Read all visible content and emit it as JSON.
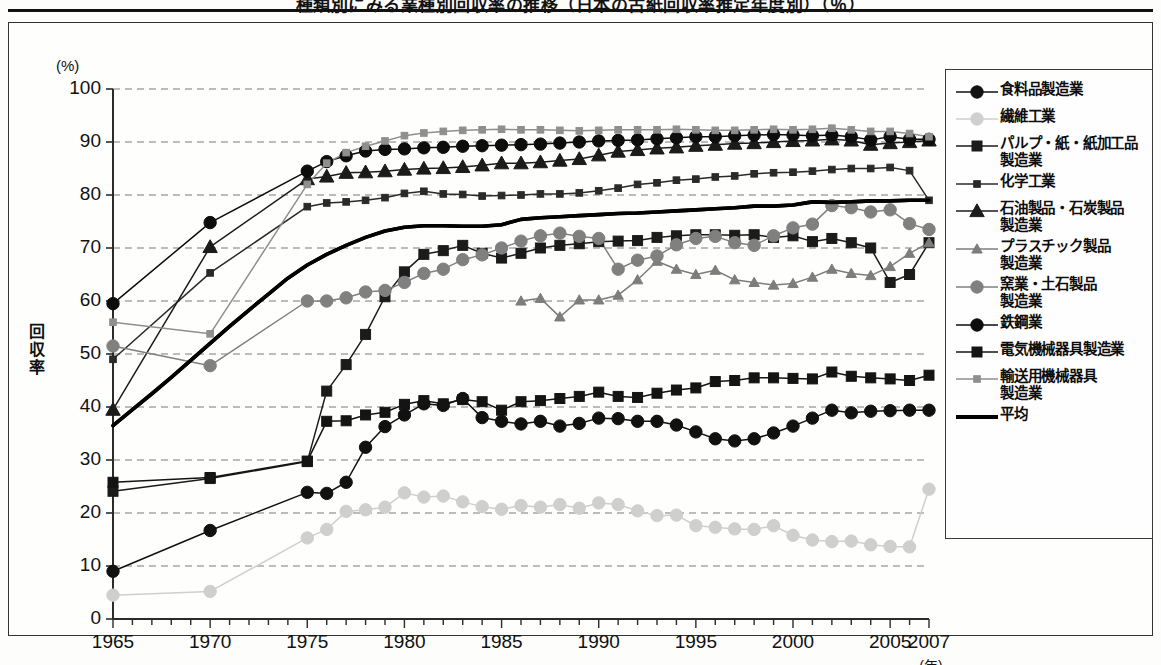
{
  "title": "種類別にみる業種別回収率の推移（日本の古紙回収率推定年度別）（％）",
  "axes": {
    "y_unit": "(%)",
    "y_title": "回収率",
    "y_ticks": [
      0,
      10,
      20,
      30,
      40,
      50,
      60,
      70,
      80,
      90,
      100
    ],
    "x_unit": "(年)",
    "x_ticks": [
      1965,
      1970,
      1975,
      1980,
      1985,
      1990,
      1995,
      2000,
      2005,
      2007
    ]
  },
  "legend": {
    "items": [
      {
        "label": "食料品製造業",
        "marker": "circle",
        "color": "#111111",
        "size": "large",
        "icon": "legend-marker-circle"
      },
      {
        "label": "繊維工業",
        "marker": "circle",
        "color": "#cfcfcf",
        "size": "large",
        "icon": "legend-marker-circle"
      },
      {
        "label": "パルプ・紙・紙加工品\n製造業",
        "marker": "square",
        "color": "#1b1b1b",
        "size": "large",
        "icon": "legend-marker-square"
      },
      {
        "label": "化学工業",
        "marker": "square",
        "color": "#2a2a2a",
        "size": "small",
        "icon": "legend-marker-square"
      },
      {
        "label": "石油製品・石炭製品\n製造業",
        "marker": "triangle",
        "color": "#1b1b1b",
        "size": "large",
        "icon": "legend-marker-triangle"
      },
      {
        "label": "プラスチック製品\n製造業",
        "marker": "triangle",
        "color": "#7d7d7d",
        "size": "small",
        "icon": "legend-marker-triangle"
      },
      {
        "label": "窯業・土石製品\n製造業",
        "marker": "circle",
        "color": "#808080",
        "size": "large",
        "icon": "legend-marker-circle"
      },
      {
        "label": "鉄鋼業",
        "marker": "circle",
        "color": "#0d0d0d",
        "size": "large",
        "icon": "legend-marker-circle"
      },
      {
        "label": "電気機械器具製造業",
        "marker": "square",
        "color": "#141414",
        "size": "large",
        "icon": "legend-marker-square"
      },
      {
        "label": "輸送用機械器具\n製造業",
        "marker": "square",
        "color": "#8f8f8f",
        "size": "small",
        "icon": "legend-marker-square"
      },
      {
        "label": "平均",
        "marker": "line",
        "color": "#000000",
        "size": "thick",
        "icon": "legend-marker-line"
      }
    ]
  },
  "chart_data": {
    "type": "line",
    "title": "種類別にみる業種別回収率の推移（日本の古紙回収率推定年度別）（％）",
    "xlabel": "(年)",
    "ylabel": "回収率",
    "yunit": "(%)",
    "xlim": [
      1965,
      2007
    ],
    "ylim": [
      0,
      100
    ],
    "grid": true,
    "legend_position": "right",
    "x": [
      1965,
      1966,
      1967,
      1968,
      1969,
      1970,
      1971,
      1972,
      1973,
      1974,
      1975,
      1976,
      1977,
      1978,
      1979,
      1980,
      1981,
      1982,
      1983,
      1984,
      1985,
      1986,
      1987,
      1988,
      1989,
      1990,
      1991,
      1992,
      1993,
      1994,
      1995,
      1996,
      1997,
      1998,
      1999,
      2000,
      2001,
      2002,
      2003,
      2004,
      2005,
      2006,
      2007
    ],
    "series": [
      {
        "name": "食料品製造業",
        "marker": "circle",
        "color": "#111111",
        "x": [
          1965,
          1970,
          1975,
          1976,
          1977,
          1978,
          1979,
          1980,
          1981,
          1982,
          1983,
          1984,
          1985,
          1986,
          1987,
          1988,
          1989,
          1990,
          1991,
          1992,
          1993,
          1994,
          1995,
          1996,
          1997,
          1998,
          1999,
          2000,
          2001,
          2002,
          2003,
          2004,
          2005,
          2006,
          2007
        ],
        "values": [
          9.0,
          16.7,
          23.9,
          23.7,
          25.8,
          32.4,
          36.3,
          38.5,
          40.6,
          40.3,
          41.6,
          38.0,
          37.3,
          36.8,
          37.3,
          36.4,
          36.9,
          37.9,
          37.8,
          37.3,
          37.3,
          36.6,
          35.3,
          34.0,
          33.6,
          34.0,
          35.1,
          36.4,
          37.9,
          39.4,
          38.9,
          39.2,
          39.3,
          39.4,
          39.4
        ]
      },
      {
        "name": "繊維工業",
        "marker": "circle",
        "color": "#cfcfcf",
        "x": [
          1965,
          1970,
          1975,
          1976,
          1977,
          1978,
          1979,
          1980,
          1981,
          1982,
          1983,
          1984,
          1985,
          1986,
          1987,
          1988,
          1989,
          1990,
          1991,
          1992,
          1993,
          1994,
          1995,
          1996,
          1997,
          1998,
          1999,
          2000,
          2001,
          2002,
          2003,
          2004,
          2005,
          2006,
          2007
        ],
        "values": [
          4.5,
          5.2,
          15.3,
          16.9,
          20.3,
          20.6,
          21.1,
          23.8,
          23.0,
          23.2,
          22.1,
          21.2,
          20.7,
          21.4,
          21.1,
          21.6,
          20.9,
          21.9,
          21.6,
          20.4,
          19.5,
          19.6,
          17.6,
          17.3,
          17.0,
          16.9,
          17.6,
          15.8,
          14.9,
          14.6,
          14.7,
          14.0,
          13.7,
          13.6,
          24.5
        ]
      },
      {
        "name": "パルプ・紙・紙加工品製造業",
        "marker": "square",
        "color": "#1b1b1b",
        "x": [
          1965,
          1970,
          1975,
          1976,
          1977,
          1978,
          1979,
          1980,
          1981,
          1982,
          1983,
          1984,
          1985,
          1986,
          1987,
          1988,
          1989,
          1990,
          1991,
          1992,
          1993,
          1994,
          1995,
          1996,
          1997,
          1998,
          1999,
          2000,
          2001,
          2002,
          2003,
          2004,
          2005,
          2006,
          2007
        ],
        "values": [
          24.1,
          26.5,
          29.7,
          43.0,
          48.0,
          53.7,
          60.8,
          65.5,
          68.8,
          69.5,
          70.5,
          69.0,
          68.1,
          69.0,
          70.0,
          70.5,
          70.8,
          71.2,
          71.3,
          71.4,
          72.0,
          72.3,
          72.5,
          72.5,
          72.4,
          72.5,
          72.0,
          72.3,
          71.2,
          71.8,
          71.0,
          70.0,
          63.5,
          65.0,
          71.0
        ]
      },
      {
        "name": "化学工業",
        "marker": "square",
        "color": "#2a2a2a",
        "x": [
          1965,
          1970,
          1975,
          1976,
          1977,
          1978,
          1979,
          1980,
          1981,
          1982,
          1983,
          1984,
          1985,
          1986,
          1987,
          1988,
          1989,
          1990,
          1991,
          1992,
          1993,
          1994,
          1995,
          1996,
          1997,
          1998,
          1999,
          2000,
          2001,
          2002,
          2003,
          2004,
          2005,
          2006,
          2007
        ],
        "values": [
          49.0,
          65.3,
          77.8,
          78.5,
          78.7,
          79.0,
          79.5,
          80.3,
          80.7,
          80.2,
          80.1,
          79.8,
          79.9,
          80.0,
          80.2,
          80.2,
          80.4,
          80.8,
          81.3,
          82.0,
          82.3,
          82.8,
          83.0,
          83.4,
          83.6,
          84.0,
          84.2,
          84.3,
          84.5,
          84.8,
          85.0,
          85.0,
          85.2,
          84.6,
          79.0
        ]
      },
      {
        "name": "石油製品・石炭製品製造業",
        "marker": "triangle",
        "color": "#1b1b1b",
        "x": [
          1965,
          1970,
          1975,
          1976,
          1977,
          1978,
          1979,
          1980,
          1981,
          1982,
          1983,
          1984,
          1985,
          1986,
          1987,
          1988,
          1989,
          1990,
          1991,
          1992,
          1993,
          1994,
          1995,
          1996,
          1997,
          1998,
          1999,
          2000,
          2001,
          2002,
          2003,
          2004,
          2005,
          2006,
          2007
        ],
        "values": [
          39.5,
          70.2,
          83.0,
          83.5,
          84.2,
          84.3,
          84.5,
          84.8,
          85.0,
          85.1,
          85.3,
          85.6,
          86.0,
          86.0,
          86.2,
          86.5,
          86.8,
          87.5,
          88.2,
          88.5,
          88.8,
          89.0,
          89.3,
          89.5,
          89.7,
          89.8,
          90.0,
          90.2,
          90.3,
          90.5,
          90.3,
          89.5,
          89.8,
          90.0,
          90.3
        ]
      },
      {
        "name": "プラスチック製品製造業",
        "marker": "triangle",
        "color": "#7d7d7d",
        "x": [
          1986,
          1987,
          1988,
          1989,
          1990,
          1991,
          1992,
          1993,
          1994,
          1995,
          1996,
          1997,
          1998,
          1999,
          2000,
          2001,
          2002,
          2003,
          2004,
          2005,
          2006,
          2007
        ],
        "values": [
          60.0,
          60.5,
          57.0,
          60.2,
          60.2,
          61.1,
          64.0,
          67.5,
          66.0,
          65.0,
          65.8,
          64.0,
          63.5,
          63.0,
          63.3,
          64.5,
          66.0,
          65.2,
          64.8,
          66.5,
          69.0,
          71.0
        ]
      },
      {
        "name": "窯業・土石製品製造業",
        "marker": "circle",
        "color": "#808080",
        "x": [
          1965,
          1970,
          1975,
          1976,
          1977,
          1978,
          1979,
          1980,
          1981,
          1982,
          1983,
          1984,
          1985,
          1986,
          1987,
          1988,
          1989,
          1990,
          1991,
          1992,
          1993,
          1994,
          1995,
          1996,
          1997,
          1998,
          1999,
          2000,
          2001,
          2002,
          2003,
          2004,
          2005,
          2006,
          2007
        ],
        "values": [
          51.5,
          47.8,
          60.0,
          60.0,
          60.6,
          61.7,
          62.0,
          63.5,
          65.2,
          66.0,
          67.8,
          68.7,
          70.0,
          71.3,
          72.3,
          72.8,
          72.2,
          71.8,
          66.0,
          67.7,
          68.5,
          70.6,
          71.8,
          72.2,
          71.0,
          70.5,
          72.3,
          73.8,
          74.5,
          78.0,
          77.6,
          76.8,
          77.2,
          74.6,
          73.5
        ]
      },
      {
        "name": "鉄鋼業",
        "marker": "circle",
        "color": "#0d0d0d",
        "x": [
          1965,
          1970,
          1975,
          1976,
          1977,
          1978,
          1979,
          1980,
          1981,
          1982,
          1983,
          1984,
          1985,
          1986,
          1987,
          1988,
          1989,
          1990,
          1991,
          1992,
          1993,
          1994,
          1995,
          1996,
          1997,
          1998,
          1999,
          2000,
          2001,
          2002,
          2003,
          2004,
          2005,
          2006,
          2007
        ],
        "values": [
          59.5,
          74.8,
          84.5,
          86.3,
          87.4,
          88.3,
          88.6,
          88.7,
          88.9,
          89.0,
          89.2,
          89.3,
          89.4,
          89.5,
          89.6,
          89.8,
          90.0,
          90.2,
          90.3,
          90.4,
          90.6,
          90.8,
          91.0,
          91.0,
          91.2,
          91.3,
          91.4,
          91.3,
          91.2,
          91.3,
          91.0,
          90.4,
          91.0,
          90.5,
          90.5
        ]
      },
      {
        "name": "電気機械器具製造業",
        "marker": "square",
        "color": "#141414",
        "x": [
          1965,
          1970,
          1975,
          1976,
          1977,
          1978,
          1979,
          1980,
          1981,
          1982,
          1983,
          1984,
          1985,
          1986,
          1987,
          1988,
          1989,
          1990,
          1991,
          1992,
          1993,
          1994,
          1995,
          1996,
          1997,
          1998,
          1999,
          2000,
          2001,
          2002,
          2003,
          2004,
          2005,
          2006,
          2007
        ],
        "values": [
          25.8,
          26.7,
          29.8,
          37.3,
          37.4,
          38.5,
          39.0,
          40.5,
          41.2,
          40.6,
          41.4,
          41.0,
          39.4,
          41.0,
          41.2,
          41.6,
          42.0,
          42.8,
          42.0,
          41.8,
          42.6,
          43.2,
          43.6,
          44.8,
          45.0,
          45.5,
          45.5,
          45.4,
          45.3,
          46.6,
          45.8,
          45.5,
          45.3,
          45.0,
          46.0
        ]
      },
      {
        "name": "輸送用機械器具製造業",
        "marker": "square",
        "color": "#8f8f8f",
        "x": [
          1965,
          1970,
          1975,
          1976,
          1977,
          1978,
          1979,
          1980,
          1981,
          1982,
          1983,
          1984,
          1985,
          1986,
          1987,
          1988,
          1989,
          1990,
          1991,
          1992,
          1993,
          1994,
          1995,
          1996,
          1997,
          1998,
          1999,
          2000,
          2001,
          2002,
          2003,
          2004,
          2005,
          2006,
          2007
        ],
        "values": [
          56.0,
          53.8,
          82.0,
          86.0,
          88.0,
          89.2,
          90.2,
          91.2,
          91.7,
          92.0,
          92.2,
          92.3,
          92.4,
          92.3,
          92.3,
          92.2,
          92.1,
          92.2,
          92.3,
          92.3,
          92.3,
          92.4,
          92.3,
          92.2,
          92.2,
          92.3,
          92.4,
          92.3,
          92.4,
          92.6,
          92.3,
          92.0,
          92.0,
          91.6,
          91.0
        ]
      },
      {
        "name": "平均",
        "marker": "line",
        "color": "#000000",
        "x": [
          1965,
          1966,
          1967,
          1968,
          1969,
          1970,
          1971,
          1972,
          1973,
          1974,
          1975,
          1976,
          1977,
          1978,
          1979,
          1980,
          1981,
          1982,
          1983,
          1984,
          1985,
          1986,
          1987,
          1988,
          1989,
          1990,
          1991,
          1992,
          1993,
          1994,
          1995,
          1996,
          1997,
          1998,
          1999,
          2000,
          2001,
          2002,
          2003,
          2004,
          2005,
          2006,
          2007
        ],
        "values": [
          36.5,
          39.5,
          42.5,
          45.6,
          48.8,
          52.0,
          55.2,
          58.3,
          61.3,
          64.3,
          66.8,
          68.8,
          70.5,
          72.0,
          73.2,
          73.9,
          74.2,
          74.2,
          74.1,
          74.1,
          74.4,
          75.4,
          75.7,
          75.9,
          76.1,
          76.3,
          76.5,
          76.6,
          76.8,
          77.0,
          77.2,
          77.4,
          77.6,
          77.9,
          77.9,
          78.1,
          78.7,
          78.6,
          78.7,
          78.9,
          78.9,
          79.0,
          79.0
        ]
      }
    ]
  }
}
